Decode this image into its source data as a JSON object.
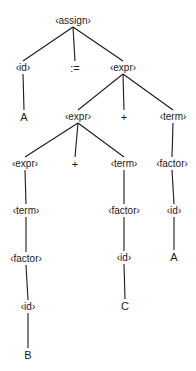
{
  "diagram": {
    "type": "parse-tree",
    "nodes": [
      {
        "id": "n0",
        "label": "‹assign›",
        "x": 73,
        "y": 21,
        "terminal": false
      },
      {
        "id": "n1",
        "label": "‹id›",
        "x": 23,
        "y": 68,
        "terminal": false
      },
      {
        "id": "n2",
        "label": ":=",
        "x": 75,
        "y": 68,
        "terminal": true
      },
      {
        "id": "n3",
        "label": "‹expr›",
        "x": 123,
        "y": 68,
        "terminal": false
      },
      {
        "id": "n4",
        "label": "A",
        "x": 24,
        "y": 117,
        "terminal": true
      },
      {
        "id": "n5",
        "label": "‹expr›",
        "x": 78,
        "y": 117,
        "terminal": false
      },
      {
        "id": "n6",
        "label": "+",
        "x": 124,
        "y": 117,
        "terminal": true
      },
      {
        "id": "n7",
        "label": "‹term›",
        "x": 173,
        "y": 117,
        "terminal": false
      },
      {
        "id": "n8",
        "label": "‹expr›",
        "x": 25,
        "y": 164,
        "terminal": false
      },
      {
        "id": "n9",
        "label": "+",
        "x": 75,
        "y": 164,
        "terminal": true
      },
      {
        "id": "n10",
        "label": "‹term›",
        "x": 124,
        "y": 164,
        "terminal": false
      },
      {
        "id": "n11",
        "label": "‹factor›",
        "x": 172,
        "y": 164,
        "terminal": false
      },
      {
        "id": "n12",
        "label": "‹term›",
        "x": 26,
        "y": 211,
        "terminal": false
      },
      {
        "id": "n13",
        "label": "‹factor›",
        "x": 124,
        "y": 211,
        "terminal": false
      },
      {
        "id": "n14",
        "label": "‹id›",
        "x": 174,
        "y": 211,
        "terminal": false
      },
      {
        "id": "n15",
        "label": "‹factor›",
        "x": 26,
        "y": 259,
        "terminal": false
      },
      {
        "id": "n16",
        "label": "‹id›",
        "x": 124,
        "y": 258,
        "terminal": false
      },
      {
        "id": "n17",
        "label": "A",
        "x": 174,
        "y": 257,
        "terminal": true
      },
      {
        "id": "n18",
        "label": "‹id›",
        "x": 28,
        "y": 307,
        "terminal": false
      },
      {
        "id": "n19",
        "label": "C",
        "x": 125,
        "y": 306,
        "terminal": true
      },
      {
        "id": "n20",
        "label": "B",
        "x": 28,
        "y": 355,
        "terminal": true
      }
    ],
    "edges": [
      [
        "n0",
        "n1"
      ],
      [
        "n0",
        "n2"
      ],
      [
        "n0",
        "n3"
      ],
      [
        "n1",
        "n4"
      ],
      [
        "n3",
        "n5"
      ],
      [
        "n3",
        "n6"
      ],
      [
        "n3",
        "n7"
      ],
      [
        "n5",
        "n8"
      ],
      [
        "n5",
        "n9"
      ],
      [
        "n5",
        "n10"
      ],
      [
        "n7",
        "n11"
      ],
      [
        "n8",
        "n12"
      ],
      [
        "n10",
        "n13"
      ],
      [
        "n11",
        "n14"
      ],
      [
        "n12",
        "n15"
      ],
      [
        "n13",
        "n16"
      ],
      [
        "n14",
        "n17"
      ],
      [
        "n15",
        "n18"
      ],
      [
        "n16",
        "n19"
      ],
      [
        "n18",
        "n20"
      ]
    ],
    "line_color": "#1a1a1a"
  }
}
